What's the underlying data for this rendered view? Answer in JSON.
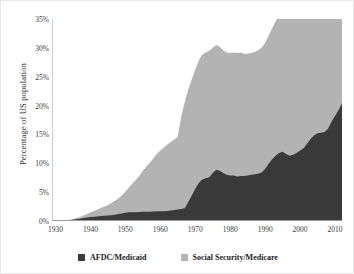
{
  "chart_data": {
    "type": "area",
    "stacked": true,
    "title": "",
    "xlabel": "",
    "ylabel": "Percentage of US population",
    "xlim": [
      1929,
      2012
    ],
    "ylim": [
      0,
      35
    ],
    "grid": false,
    "legend_position": "bottom",
    "xticks": [
      1930,
      1940,
      1950,
      1960,
      1970,
      1980,
      1990,
      2000,
      2010
    ],
    "xtick_labels": [
      "1930",
      "1940",
      "1950",
      "1960",
      "1970",
      "1980",
      "1990",
      "2000",
      "2010"
    ],
    "yticks": [
      0,
      5,
      10,
      15,
      20,
      25,
      30,
      35
    ],
    "ytick_labels": [
      "0%",
      "5%",
      "10%",
      "15%",
      "20%",
      "25%",
      "30%",
      "35%"
    ],
    "colors": {
      "afdc_medicaid": "#3a3a3a",
      "social_security_medicare": "#b3b3b3",
      "axis": "#9a9a9a",
      "text": "#2b2b2b",
      "background": "#ffffff"
    },
    "x": [
      1929,
      1930,
      1931,
      1932,
      1933,
      1934,
      1935,
      1936,
      1937,
      1938,
      1939,
      1940,
      1941,
      1942,
      1943,
      1944,
      1945,
      1946,
      1947,
      1948,
      1949,
      1950,
      1951,
      1952,
      1953,
      1954,
      1955,
      1956,
      1957,
      1958,
      1959,
      1960,
      1961,
      1962,
      1963,
      1964,
      1965,
      1966,
      1967,
      1968,
      1969,
      1970,
      1971,
      1972,
      1973,
      1974,
      1975,
      1976,
      1977,
      1978,
      1979,
      1980,
      1981,
      1982,
      1983,
      1984,
      1985,
      1986,
      1987,
      1988,
      1989,
      1990,
      1991,
      1992,
      1993,
      1994,
      1995,
      1996,
      1997,
      1998,
      1999,
      2000,
      2001,
      2002,
      2003,
      2004,
      2005,
      2006,
      2007,
      2008,
      2009,
      2010,
      2011,
      2012
    ],
    "series": [
      {
        "name": "AFDC/Medicaid",
        "color": "#3a3a3a",
        "values": [
          0.0,
          0.0,
          0.0,
          0.0,
          0.05,
          0.1,
          0.2,
          0.3,
          0.4,
          0.5,
          0.6,
          0.7,
          0.75,
          0.8,
          0.85,
          0.9,
          0.95,
          1.0,
          1.1,
          1.2,
          1.3,
          1.45,
          1.5,
          1.5,
          1.5,
          1.55,
          1.6,
          1.6,
          1.6,
          1.65,
          1.7,
          1.7,
          1.7,
          1.75,
          1.8,
          1.9,
          2.0,
          2.1,
          2.2,
          3.3,
          4.4,
          5.6,
          6.6,
          7.2,
          7.4,
          7.6,
          8.3,
          8.9,
          8.7,
          8.3,
          8.0,
          7.9,
          7.9,
          7.7,
          7.8,
          7.8,
          7.9,
          8.0,
          8.1,
          8.2,
          8.4,
          9.0,
          9.9,
          10.7,
          11.3,
          11.8,
          12.0,
          11.6,
          11.3,
          11.5,
          11.8,
          12.2,
          12.6,
          13.4,
          14.2,
          14.8,
          15.2,
          15.3,
          15.4,
          16.0,
          17.2,
          18.2,
          19.2,
          20.4
        ]
      },
      {
        "name": "Social Security/Medicare",
        "color": "#b3b3b3",
        "values": [
          0.0,
          0.0,
          0.0,
          0.0,
          0.05,
          0.1,
          0.15,
          0.2,
          0.3,
          0.45,
          0.6,
          0.8,
          1.0,
          1.2,
          1.4,
          1.6,
          1.8,
          2.1,
          2.4,
          2.7,
          3.1,
          3.6,
          4.3,
          5.0,
          5.6,
          6.3,
          7.1,
          7.8,
          8.5,
          9.2,
          9.9,
          10.5,
          11.0,
          11.5,
          11.9,
          12.2,
          12.6,
          16.0,
          18.4,
          19.5,
          20.1,
          20.6,
          21.2,
          21.6,
          21.8,
          21.9,
          21.7,
          21.6,
          21.5,
          21.3,
          21.2,
          21.2,
          21.3,
          21.4,
          21.4,
          21.2,
          21.1,
          21.1,
          21.2,
          21.4,
          21.6,
          21.9,
          22.2,
          22.7,
          23.3,
          23.9,
          24.8,
          26.2,
          26.4,
          25.8,
          26.2,
          27.2,
          28.0,
          28.6,
          29.2,
          29.6,
          30.0,
          30.2,
          30.6,
          31.5,
          32.2,
          33.0,
          33.8,
          34.9
        ]
      }
    ]
  },
  "legend": {
    "items": [
      {
        "label": "AFDC/Medicaid",
        "color": "#3a3a3a"
      },
      {
        "label": "Social Security/Medicare",
        "color": "#b3b3b3"
      }
    ]
  },
  "axes": {
    "ylabel": "Percentage of US population"
  }
}
